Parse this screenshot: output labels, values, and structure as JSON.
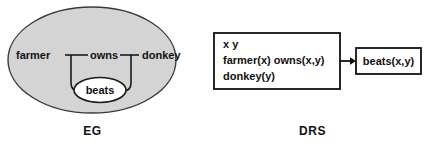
{
  "figure": {
    "type": "diagram",
    "background_color": "#ffffff",
    "panels": [
      {
        "id": "eg",
        "caption": "EG",
        "description": "Existential graph: outer shaded oval (cut) containing farmer-owns-donkey line of identity, with an inner white oval containing beats",
        "outer_oval": {
          "fill_color": "#d4d4d4",
          "stroke_color": "#333333"
        },
        "inner_oval": {
          "label": "beats",
          "fill_color": "#ffffff",
          "stroke_color": "#1a1a1a"
        },
        "nodes": [
          {
            "id": "farmer",
            "label": "farmer"
          },
          {
            "id": "owns",
            "label": "owns"
          },
          {
            "id": "donkey",
            "label": "donkey"
          }
        ]
      },
      {
        "id": "drs",
        "caption": "DRS",
        "description": "Discourse representation structure: antecedent box with discourse referents and conditions, arrow to consequent box",
        "antecedent_box": {
          "discourse_referents": "x   y",
          "conditions": [
            "farmer(x)  owns(x,y)",
            "donkey(y)"
          ],
          "border_color": "#111111",
          "fill_color": "#ffffff"
        },
        "arrow": {
          "symbol": "arrow-right",
          "color": "#111111"
        },
        "consequent_box": {
          "condition": "beats(x,y)",
          "border_color": "#111111",
          "fill_color": "#ffffff"
        }
      }
    ]
  }
}
